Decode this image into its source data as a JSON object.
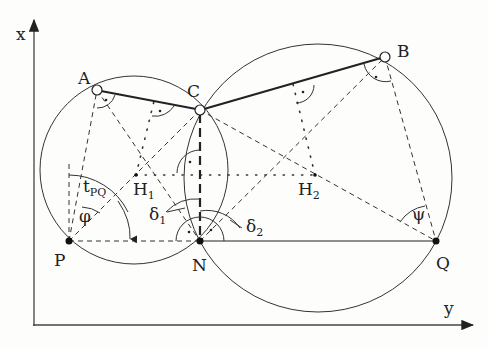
{
  "diagram": {
    "type": "geometric-construction",
    "axes": {
      "vertical_label": "x",
      "horizontal_label": "y"
    },
    "points": {
      "A": {
        "label": "A",
        "x": 97,
        "y": 90,
        "style": "open-circle"
      },
      "B": {
        "label": "B",
        "x": 385,
        "y": 57,
        "style": "open-circle"
      },
      "C": {
        "label": "C",
        "x": 200,
        "y": 110,
        "style": "open-circle"
      },
      "N": {
        "label": "N",
        "x": 200,
        "y": 241,
        "style": "filled-dot"
      },
      "P": {
        "label": "P",
        "x": 69,
        "y": 241,
        "style": "filled-dot"
      },
      "Q": {
        "label": "Q",
        "x": 436,
        "y": 241,
        "style": "filled-dot"
      },
      "H1": {
        "label": "H",
        "sub": "1",
        "x": 136,
        "y": 175,
        "style": "small-dot"
      },
      "H2": {
        "label": "H",
        "sub": "2",
        "x": 315,
        "y": 175,
        "style": "small-dot"
      }
    },
    "angle_labels": {
      "tPQ": {
        "main": "t",
        "sub": "PQ"
      },
      "phi": {
        "main": "φ"
      },
      "psi": {
        "main": "ψ"
      },
      "delta1": {
        "main": "δ",
        "sub": "1"
      },
      "delta2": {
        "main": "δ",
        "sub": "2"
      }
    },
    "circles": [
      {
        "name": "left-circle",
        "cx": 134,
        "cy": 170,
        "r": 94,
        "through": [
          "A",
          "C",
          "P",
          "N"
        ]
      },
      {
        "name": "right-circle",
        "cx": 318,
        "cy": 178,
        "r": 134,
        "through": [
          "C",
          "B",
          "Q",
          "N"
        ]
      }
    ],
    "edges": {
      "solid_thick": [
        [
          "A",
          "C"
        ],
        [
          "C",
          "B"
        ]
      ],
      "solid": [
        [
          "N",
          "Q"
        ]
      ],
      "dashed": [
        [
          "P",
          "N"
        ],
        [
          "P",
          "A"
        ],
        [
          "P",
          "C"
        ],
        [
          "A",
          "N"
        ],
        [
          "C",
          "Q"
        ],
        [
          "N",
          "B"
        ],
        [
          "B",
          "Q"
        ]
      ],
      "thick_dashed": [
        [
          "C",
          "N"
        ]
      ],
      "dotted": [
        [
          "H1",
          "H2"
        ]
      ]
    }
  }
}
